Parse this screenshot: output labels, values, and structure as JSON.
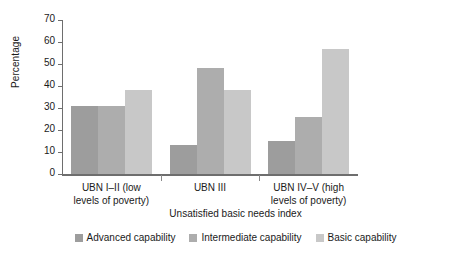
{
  "chart_data": {
    "type": "bar",
    "title": "",
    "xlabel": "Unsatisfied basic needs index",
    "ylabel": "Percentage",
    "categories": [
      "UBN I–II (low\nlevels of poverty)",
      "UBN III",
      "UBN IV–V (high\nlevels of poverty)"
    ],
    "series": [
      {
        "name": "Advanced capability",
        "values": [
          31,
          13,
          15
        ],
        "color": "#9d9d9d"
      },
      {
        "name": "Intermediate capability",
        "values": [
          31,
          48,
          26
        ],
        "color": "#adadad"
      },
      {
        "name": "Basic capability",
        "values": [
          38,
          38,
          57
        ],
        "color": "#c8c8c8"
      }
    ],
    "ylim": [
      0,
      70
    ],
    "yticks": [
      0,
      10,
      20,
      30,
      40,
      50,
      60,
      70
    ],
    "ytick_labels": [
      "0",
      "10",
      "20",
      "30",
      "40",
      "50",
      "60",
      "70"
    ],
    "grid": false,
    "legend_position": "bottom"
  }
}
